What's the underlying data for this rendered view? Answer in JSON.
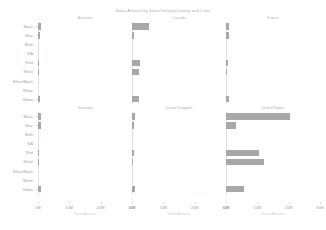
{
  "chart_data": {
    "type": "bar",
    "title": "Sales Amount by SalesTerritoryCountry and Color",
    "xlabel": "SalesAmount",
    "ylabel": "",
    "orientation": "horizontal",
    "facet": true,
    "facet_rows": 2,
    "facet_cols": 3,
    "xlim": [
      0,
      30
    ],
    "xticks": [
      0,
      10,
      20,
      30
    ],
    "xticklabels": [
      "0M",
      "10M",
      "20M",
      "30M"
    ],
    "grid": false,
    "legend": "none",
    "bar_color": "#a8a8a8",
    "categories": [
      "Black",
      "Blue",
      "Multi",
      "NA",
      "Red",
      "Silver",
      "Silver/Black",
      "White",
      "Yellow"
    ],
    "panels": [
      {
        "name": "Australia",
        "row": 0,
        "col": 0,
        "values": [
          0.9,
          0.5,
          0.0,
          0.0,
          0.35,
          0.3,
          0.0,
          0.0,
          0.55
        ]
      },
      {
        "name": "Canada",
        "row": 0,
        "col": 1,
        "values": [
          5.3,
          0.55,
          0.0,
          0.0,
          2.4,
          2.2,
          0.0,
          0.0,
          2.3
        ]
      },
      {
        "name": "France",
        "row": 0,
        "col": 2,
        "values": [
          1.0,
          0.85,
          0.0,
          0.0,
          0.5,
          0.45,
          0.0,
          0.0,
          0.9
        ]
      },
      {
        "name": "Germany",
        "row": 1,
        "col": 0,
        "values": [
          0.9,
          0.8,
          0.0,
          0.0,
          0.3,
          0.25,
          0.0,
          0.0,
          0.85
        ]
      },
      {
        "name": "United Kingdom",
        "row": 1,
        "col": 1,
        "values": [
          1.0,
          0.6,
          0.0,
          0.0,
          0.7,
          0.35,
          0.0,
          0.0,
          0.95
        ]
      },
      {
        "name": "United States",
        "row": 1,
        "col": 2,
        "values": [
          20.5,
          3.1,
          0.0,
          0.0,
          10.5,
          12.2,
          0.0,
          0.0,
          5.7
        ]
      }
    ]
  },
  "title": "Sales Amount by SalesTerritoryCountry and Color",
  "axis": {
    "x_title": "SalesAmount",
    "x_ticklabels": [
      "0M",
      "10M",
      "20M",
      "30M"
    ]
  },
  "categories": [
    "Black",
    "Blue",
    "Multi",
    "NA",
    "Red",
    "Silver",
    "Silver/Black",
    "White",
    "Yellow"
  ],
  "panel_titles": [
    "Australia",
    "Canada",
    "France",
    "Germany",
    "United Kingdom",
    "United States"
  ]
}
